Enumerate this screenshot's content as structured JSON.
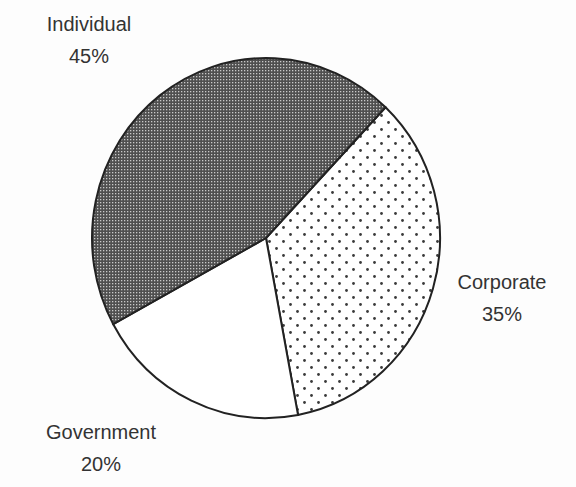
{
  "chart_data": {
    "type": "pie",
    "title": "",
    "categories": [
      "Individual",
      "Corporate",
      "Government"
    ],
    "values": [
      45,
      35,
      20
    ],
    "unit": "%",
    "start_angle_deg": 43.4,
    "direction": "clockwise",
    "order_from_start": [
      "Corporate",
      "Government",
      "Individual"
    ],
    "slices": [
      {
        "name": "Corporate",
        "value": 35,
        "label": "Corporate",
        "pct_label": "35%",
        "fill": "dots",
        "color": "#ffffff",
        "pattern_color": "#444444"
      },
      {
        "name": "Government",
        "value": 20,
        "label": "Government",
        "pct_label": "20%",
        "fill": "solid",
        "color": "#ffffff"
      },
      {
        "name": "Individual",
        "value": 45,
        "label": "Individual",
        "pct_label": "45%",
        "fill": "crosshatch",
        "color": "#555555",
        "pattern_color": "#c8c8c8"
      }
    ],
    "legend": "none (direct labels)",
    "outline_color": "#222222"
  },
  "labels": {
    "individual": {
      "name": "Individual",
      "pct": "45%"
    },
    "corporate": {
      "name": "Corporate",
      "pct": "35%"
    },
    "government": {
      "name": "Government",
      "pct": "20%"
    }
  }
}
